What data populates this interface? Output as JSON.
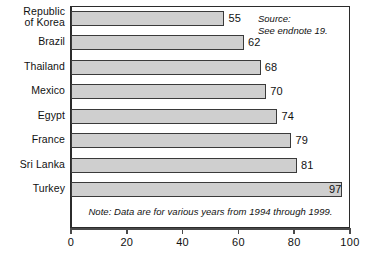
{
  "chart_data": {
    "type": "bar",
    "orientation": "horizontal",
    "title": "",
    "xlabel": "",
    "ylabel": "",
    "xlim": [
      0,
      100
    ],
    "xticks": [
      0,
      20,
      40,
      60,
      80,
      100
    ],
    "grid": false,
    "legend": null,
    "categories": [
      "Republic\nof Korea",
      "Brazil",
      "Thailand",
      "Mexico",
      "Egypt",
      "France",
      "Sri Lanka",
      "Turkey"
    ],
    "values": [
      55,
      62,
      68,
      70,
      74,
      79,
      81,
      97
    ],
    "value_labels": [
      "55",
      "62",
      "68",
      "70",
      "74",
      "79",
      "81",
      "97"
    ],
    "label_placement": [
      "outside",
      "outside",
      "outside",
      "outside",
      "outside",
      "outside",
      "outside",
      "inside"
    ],
    "bar_fill_color": "#cfcfcf",
    "bar_border_color": "#3a3a3a",
    "axis_color": "#2b2b2b",
    "annotations": {
      "source": "Source:\nSee endnote 19.",
      "note": "Note: Data are for various years from 1994 through 1999."
    }
  }
}
